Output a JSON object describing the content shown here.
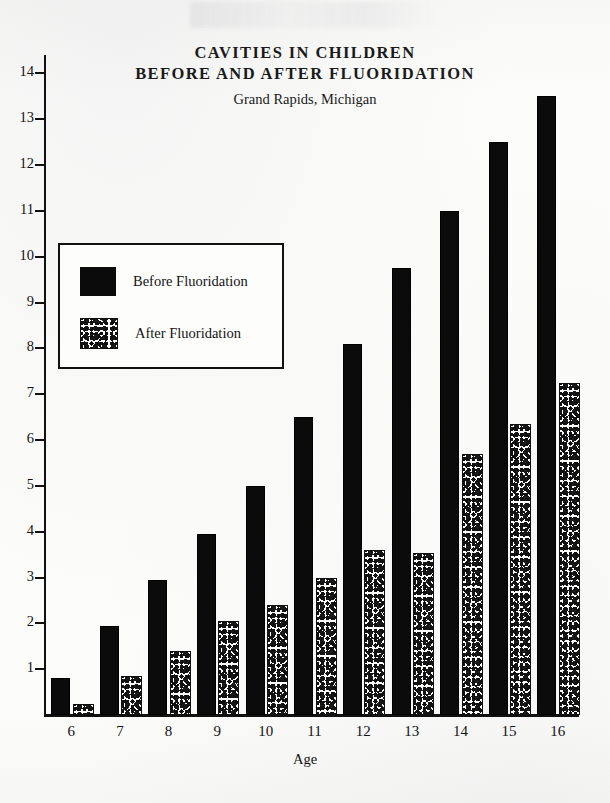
{
  "chart_data": {
    "type": "bar",
    "title": "CAVITIES IN CHILDREN",
    "title_line2": "BEFORE AND AFTER FLUORIDATION",
    "subtitle": "Grand Rapids, Michigan",
    "xlabel": "Age",
    "ylabel": "",
    "categories": [
      "6",
      "7",
      "8",
      "9",
      "10",
      "11",
      "12",
      "13",
      "14",
      "15",
      "16"
    ],
    "ylim": [
      0,
      14.4
    ],
    "yticks": [
      1,
      2,
      3,
      4,
      5,
      6,
      7,
      8,
      9,
      10,
      11,
      12,
      13,
      14
    ],
    "ytick_labels": [
      "1",
      "2",
      "3",
      "4",
      "5",
      "6",
      "7",
      "8",
      "9",
      "10",
      "11",
      "12",
      "13",
      "14"
    ],
    "grid": false,
    "legend_position": "upper-left-inset",
    "series": [
      {
        "name": "Before Fluoridation",
        "fill": "solid-black",
        "color": "#0b0b0b",
        "values": [
          0.8,
          1.95,
          2.95,
          3.95,
          5.0,
          6.5,
          8.1,
          9.75,
          11.0,
          12.5,
          13.5
        ]
      },
      {
        "name": "After Fluoridation",
        "fill": "stipple",
        "color": "#fdfdfc",
        "values": [
          0.2,
          0.8,
          1.35,
          2.0,
          2.35,
          2.95,
          3.55,
          3.5,
          5.65,
          6.3,
          7.2
        ]
      }
    ]
  },
  "legend": {
    "items": [
      {
        "label": "Before Fluoridation",
        "swatch": "solid"
      },
      {
        "label": "After Fluoridation",
        "swatch": "stipple"
      }
    ]
  }
}
